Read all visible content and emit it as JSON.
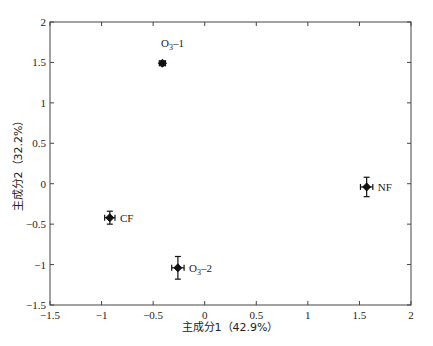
{
  "chart_data": {
    "type": "scatter",
    "title": "",
    "xlabel": "主成分1（42.9%）",
    "ylabel": "主成分2（32.2%）",
    "xlim": [
      -1.5,
      2
    ],
    "ylim": [
      -1.5,
      2
    ],
    "xticks": [
      -1.5,
      -1,
      -0.5,
      0,
      0.5,
      1,
      1.5,
      2
    ],
    "yticks": [
      -1.5,
      -1,
      -0.5,
      0,
      0.5,
      1,
      1.5,
      2
    ],
    "xtick_labels": [
      "-1.5",
      "-1",
      "-0.5",
      "0",
      "0.5",
      "1",
      "1.5",
      "2"
    ],
    "ytick_labels": [
      "-1.5",
      "-1",
      "-0.5",
      "0",
      "0.5",
      "1",
      "1.5",
      "2"
    ],
    "grid": false,
    "legend": null,
    "series": [
      {
        "name": "PCA scores",
        "marker": "diamond",
        "color": "#111111",
        "points": [
          {
            "label": "O3-1",
            "label_main": "O",
            "label_sub": "3",
            "label_suffix": "-1",
            "x": -0.41,
            "y": 1.49,
            "xerr": 0.03,
            "yerr": 0.03,
            "label_pos": "above"
          },
          {
            "label": "CF",
            "label_main": "CF",
            "label_sub": "",
            "label_suffix": "",
            "x": -0.92,
            "y": -0.42,
            "xerr": 0.05,
            "yerr": 0.08,
            "label_pos": "right"
          },
          {
            "label": "O3-2",
            "label_main": "O",
            "label_sub": "3",
            "label_suffix": "-2",
            "x": -0.26,
            "y": -1.04,
            "xerr": 0.06,
            "yerr": 0.14,
            "label_pos": "right"
          },
          {
            "label": "NF",
            "label_main": "NF",
            "label_sub": "",
            "label_suffix": "",
            "x": 1.57,
            "y": -0.04,
            "xerr": 0.06,
            "yerr": 0.12,
            "label_pos": "right"
          }
        ]
      }
    ]
  }
}
